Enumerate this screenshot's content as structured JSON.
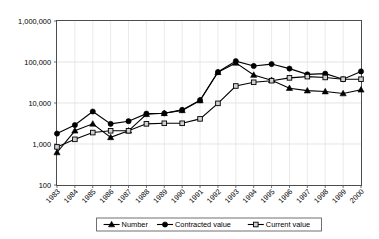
{
  "chart_data": {
    "type": "line",
    "title": "",
    "subtitle": "",
    "xlabel": "",
    "ylabel": "",
    "yscale": "log",
    "ylim": [
      100,
      1000000
    ],
    "ytick_labels": [
      "1,000,000",
      "100,000",
      "10,000",
      "1,000",
      "100"
    ],
    "ytick_values": [
      1000000,
      100000,
      10000,
      1000,
      100
    ],
    "grid": true,
    "legend_position": "bottom",
    "categories": [
      "1983",
      "1984",
      "1985",
      "1986",
      "1987",
      "1988",
      "1989",
      "1990",
      "1991",
      "1992",
      "1993",
      "1994",
      "1995",
      "1996",
      "1997",
      "1998",
      "1999",
      "2000"
    ],
    "series": [
      {
        "name": "Number",
        "marker": "filled-triangle",
        "values": [
          620,
          2100,
          3100,
          1450,
          2100,
          5300,
          5600,
          6600,
          11500,
          56000,
          95000,
          48000,
          36000,
          23000,
          20000,
          19000,
          17000,
          21000
        ]
      },
      {
        "name": "Contracted value",
        "marker": "filled-circle",
        "values": [
          1800,
          2900,
          6200,
          3100,
          3600,
          5500,
          5600,
          6800,
          11700,
          57000,
          105000,
          80000,
          89000,
          69000,
          50000,
          52000,
          38000,
          59000
        ]
      },
      {
        "name": "Current value",
        "marker": "open-square",
        "values": [
          850,
          1300,
          1900,
          2100,
          2100,
          3100,
          3200,
          3200,
          4100,
          9800,
          26000,
          32000,
          35000,
          41000,
          44000,
          42000,
          38000,
          38000
        ]
      }
    ]
  },
  "legend": {
    "items": [
      {
        "label": "Number",
        "marker": "filled-triangle"
      },
      {
        "label": "Contracted value",
        "marker": "filled-circle"
      },
      {
        "label": "Current value",
        "marker": "open-square"
      }
    ]
  },
  "colors": {
    "line": "#000000",
    "frame": "#4d4d4d",
    "grid": "#d9d9d9",
    "background": "#ffffff",
    "open_marker_fill": "#d0d0d0"
  }
}
